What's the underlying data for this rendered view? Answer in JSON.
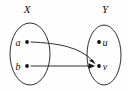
{
  "diagram": {
    "type": "set-mapping-diagram",
    "background_color": "#fefefe",
    "stroke_color": "#1a1a1a",
    "sets": [
      {
        "id": "X",
        "label": "X",
        "label_x": 27,
        "label_y": 13,
        "ellipse": {
          "cx": 30,
          "cy": 54,
          "rx": 20,
          "ry": 31
        },
        "elements": [
          {
            "id": "a",
            "label": "a",
            "dot_x": 27,
            "dot_y": 42,
            "label_x": 18,
            "label_y": 45
          },
          {
            "id": "b",
            "label": "b",
            "dot_x": 27,
            "dot_y": 66,
            "label_x": 18,
            "label_y": 69
          }
        ]
      },
      {
        "id": "Y",
        "label": "Y",
        "label_x": 105,
        "label_y": 13,
        "ellipse": {
          "cx": 104,
          "cy": 55,
          "rx": 17,
          "ry": 30
        },
        "elements": [
          {
            "id": "u",
            "label": "u",
            "dot_x": 99,
            "dot_y": 42,
            "label_x": 105,
            "label_y": 45
          },
          {
            "id": "v",
            "label": "v",
            "dot_x": 99,
            "dot_y": 66,
            "label_x": 105,
            "label_y": 69
          }
        ]
      }
    ],
    "arrows": [
      {
        "id": "a-to-v",
        "from": "a",
        "to": "v",
        "style": "curved",
        "path": "M 31 42 C 58 43, 80 47, 93 61"
      },
      {
        "id": "b-to-v",
        "from": "b",
        "to": "v",
        "style": "straight",
        "path": "M 31 66 L 92 66"
      }
    ],
    "caption": "Two elements a and b of set X both map to element v of set Y"
  }
}
